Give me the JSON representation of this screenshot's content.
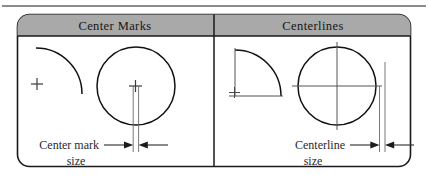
{
  "figure": {
    "type": "technical-drawing-comparison",
    "top_rule": true,
    "panels": [
      {
        "id": "center-marks",
        "header": "Center Marks",
        "caption_line1": "Center mark",
        "caption_line2": "size",
        "shapes": [
          "quarter-arc-no-centerlines",
          "circle-with-center-mark"
        ],
        "annotation": "dimension-between-two-vertical-lines"
      },
      {
        "id": "centerlines",
        "header": "Centerlines",
        "caption_line1": "Centerline",
        "caption_line2": "size",
        "shapes": [
          "quarter-arc-with-centerlines",
          "circle-with-full-centerlines"
        ],
        "annotation": "dimension-between-two-vertical-lines"
      }
    ],
    "colors": {
      "header_fill": "#a9a9a9",
      "frame_stroke": "#1a1a1a",
      "geometry_stroke": "#111111",
      "centerline_stroke": "#555555",
      "text": "#1c1c1c",
      "background": "#ffffff"
    }
  }
}
